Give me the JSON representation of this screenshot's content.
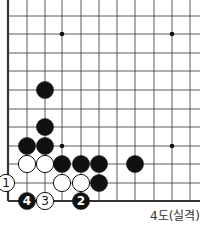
{
  "diagram": {
    "type": "go-board-fragment",
    "caption": "4도(실격)",
    "grid": {
      "cols_x": [
        8,
        27,
        45,
        62,
        81,
        99,
        117,
        135,
        154,
        172,
        190
      ],
      "rows_y": [
        16,
        34,
        53,
        71,
        90,
        109,
        127,
        146,
        164,
        183,
        201
      ],
      "right_extent": 200,
      "top_extent": 0,
      "left_edge_col": 0,
      "bottom_edge_row": 10
    },
    "star_points": [
      [
        3,
        1
      ],
      [
        9,
        1
      ],
      [
        3,
        7
      ],
      [
        9,
        7
      ]
    ],
    "stones": [
      {
        "color": "black",
        "col": 2,
        "row": 4,
        "label": ""
      },
      {
        "color": "black",
        "col": 2,
        "row": 6,
        "label": ""
      },
      {
        "color": "black",
        "col": 1,
        "row": 7,
        "label": ""
      },
      {
        "color": "black",
        "col": 2,
        "row": 7,
        "label": ""
      },
      {
        "color": "white",
        "col": 1,
        "row": 8,
        "label": ""
      },
      {
        "color": "white",
        "col": 2,
        "row": 8,
        "label": ""
      },
      {
        "color": "black",
        "col": 3,
        "row": 8,
        "label": ""
      },
      {
        "color": "black",
        "col": 4,
        "row": 8,
        "label": ""
      },
      {
        "color": "black",
        "col": 5,
        "row": 8,
        "label": ""
      },
      {
        "color": "black",
        "col": 7,
        "row": 8,
        "label": ""
      },
      {
        "color": "white",
        "col": 0,
        "row": 9,
        "label": "1",
        "x_override": 6
      },
      {
        "color": "white",
        "col": 3,
        "row": 9,
        "label": ""
      },
      {
        "color": "white",
        "col": 4,
        "row": 9,
        "label": ""
      },
      {
        "color": "black",
        "col": 5,
        "row": 9,
        "label": ""
      },
      {
        "color": "black",
        "col": 1,
        "row": 10,
        "label": "4"
      },
      {
        "color": "white",
        "col": 2,
        "row": 10,
        "label": "3"
      },
      {
        "color": "black",
        "col": 4,
        "row": 10,
        "label": "2"
      }
    ]
  }
}
